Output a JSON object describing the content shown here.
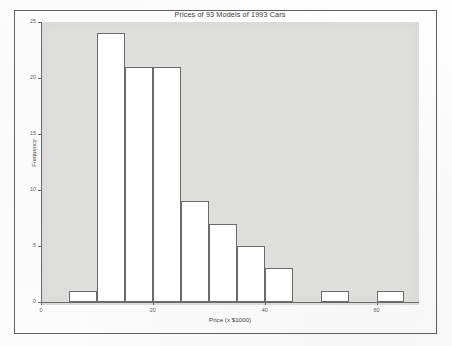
{
  "chart_data": {
    "type": "bar",
    "title": "Prices of 93 Models of 1993 Cars",
    "xlabel": "Price (x $1000)",
    "ylabel": "Frequency",
    "grid": false,
    "legend": null,
    "bin_width": 5,
    "bin_edges": [
      5,
      10,
      15,
      20,
      25,
      30,
      35,
      40,
      45,
      50,
      55,
      60,
      65
    ],
    "categories": [
      "5-10",
      "10-15",
      "15-20",
      "20-25",
      "25-30",
      "30-35",
      "35-40",
      "40-45",
      "45-50",
      "50-55",
      "55-60",
      "60-65"
    ],
    "values": [
      1,
      24,
      21,
      21,
      9,
      7,
      5,
      3,
      0,
      1,
      0,
      1
    ],
    "xlim": [
      5,
      65
    ],
    "ylim": [
      0,
      25
    ],
    "xticks": [
      0,
      20,
      40,
      60
    ],
    "xtick_labels": [
      "0",
      "20",
      "40",
      "60"
    ],
    "yticks": [
      0,
      5,
      10,
      15,
      20,
      25
    ],
    "ytick_labels": [
      "0",
      "5",
      "10",
      "15",
      "20",
      "25"
    ]
  },
  "style": {
    "plot_background": "#dededc",
    "bar_fill": "#ffffff",
    "bar_edge": "#6b6b6b",
    "axis_color": "#6a6a6a",
    "frame_color": "#5f5f5f",
    "text_color": "#3a3a3a"
  }
}
